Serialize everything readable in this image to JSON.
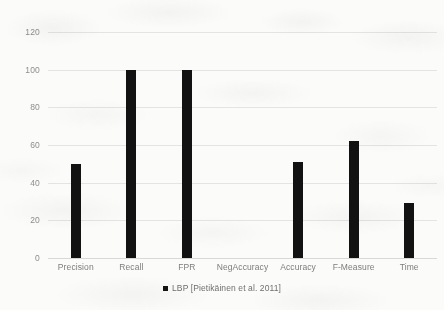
{
  "chart_data": {
    "type": "bar",
    "title": "",
    "subtitle": "",
    "xlabel": "",
    "ylabel": "",
    "categories": [
      "Precision",
      "Recall",
      "FPR",
      "NegAccuracy",
      "Accuracy",
      "F-Measure",
      "Time"
    ],
    "series": [
      {
        "name": "LBP [Pietikäinen et al. 2011]",
        "color": "#121212",
        "values": [
          50,
          100,
          100,
          0,
          51,
          62,
          29
        ]
      }
    ],
    "values": [
      50,
      100,
      100,
      0,
      51,
      62,
      29
    ],
    "ylim": [
      0,
      120
    ],
    "ytick_values": [
      0,
      20,
      40,
      60,
      80,
      100,
      120
    ],
    "ytick_labels": [
      "0",
      "20",
      "40",
      "60",
      "80",
      "100",
      "120"
    ],
    "grid": true,
    "grid_axis": "y",
    "legend": [
      "LBP [Pietikäinen et al. 2011]"
    ],
    "legend_position": "bottom-center",
    "annotations": []
  },
  "legend": {
    "marker": "square-marker",
    "label": "LBP [Pietikäinen et al. 2011]"
  },
  "colors": {
    "bar": "#121212",
    "gridline": "#e4e4e4",
    "baseline": "#d8d8d8",
    "tick_text": "#8e8e8e",
    "category_text": "#7d7d7d",
    "legend_text": "#6f6f6f",
    "background": "#fbfbfa"
  }
}
